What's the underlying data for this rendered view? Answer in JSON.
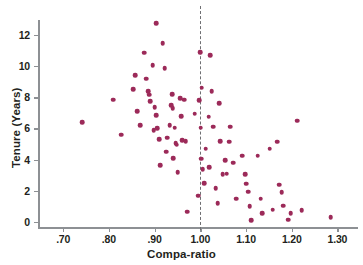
{
  "chart_data": {
    "type": "scatter",
    "title": "",
    "xlabel": "Compa-ratio",
    "ylabel": "Tenure (Years)",
    "xlim": [
      0.645,
      1.345
    ],
    "ylim": [
      -0.35,
      12.95
    ],
    "xticks": [
      0.7,
      0.8,
      0.9,
      1.0,
      1.1,
      1.2,
      1.3
    ],
    "xticklabels": [
      ".70",
      ".80",
      ".90",
      "1.00",
      "1.10",
      "1.20",
      "1.30"
    ],
    "yticks": [
      0,
      2,
      4,
      6,
      8,
      10,
      12
    ],
    "yticklabels": [
      "0",
      "2",
      "4",
      "6",
      "8",
      "10",
      "12"
    ],
    "grid": false,
    "legend": null,
    "marker_color": "#9c2a59",
    "marker_size": 4.6,
    "annotations": [
      {
        "name": "reference-line",
        "type": "vline",
        "x": 1.0,
        "style": "dashed",
        "color": "#6f6f72"
      }
    ],
    "points": [
      {
        "x": 0.742,
        "y": 6.4
      },
      {
        "x": 0.809,
        "y": 7.85
      },
      {
        "x": 0.827,
        "y": 5.6
      },
      {
        "x": 0.853,
        "y": 8.5
      },
      {
        "x": 0.858,
        "y": 9.4
      },
      {
        "x": 0.862,
        "y": 7.1
      },
      {
        "x": 0.868,
        "y": 6.2
      },
      {
        "x": 0.877,
        "y": 10.85
      },
      {
        "x": 0.882,
        "y": 9.2
      },
      {
        "x": 0.886,
        "y": 8.4
      },
      {
        "x": 0.888,
        "y": 8.15
      },
      {
        "x": 0.89,
        "y": 7.75
      },
      {
        "x": 0.896,
        "y": 10.05
      },
      {
        "x": 0.898,
        "y": 5.9
      },
      {
        "x": 0.9,
        "y": 7.35
      },
      {
        "x": 0.903,
        "y": 12.75
      },
      {
        "x": 0.904,
        "y": 6.85
      },
      {
        "x": 0.906,
        "y": 6.0
      },
      {
        "x": 0.91,
        "y": 5.3
      },
      {
        "x": 0.912,
        "y": 3.65
      },
      {
        "x": 0.918,
        "y": 11.45
      },
      {
        "x": 0.922,
        "y": 9.85
      },
      {
        "x": 0.925,
        "y": 4.5
      },
      {
        "x": 0.928,
        "y": 5.4
      },
      {
        "x": 0.933,
        "y": 6.2
      },
      {
        "x": 0.936,
        "y": 7.5
      },
      {
        "x": 0.938,
        "y": 8.2
      },
      {
        "x": 0.94,
        "y": 7.3
      },
      {
        "x": 0.941,
        "y": 4.1
      },
      {
        "x": 0.944,
        "y": 6.05
      },
      {
        "x": 0.946,
        "y": 5.05
      },
      {
        "x": 0.948,
        "y": 4.95
      },
      {
        "x": 0.951,
        "y": 3.2
      },
      {
        "x": 0.956,
        "y": 7.95
      },
      {
        "x": 0.958,
        "y": 6.8
      },
      {
        "x": 0.96,
        "y": 5.25
      },
      {
        "x": 0.965,
        "y": 7.85
      },
      {
        "x": 0.968,
        "y": 5.2
      },
      {
        "x": 0.972,
        "y": 0.65
      },
      {
        "x": 0.988,
        "y": 6.95
      },
      {
        "x": 0.995,
        "y": 1.7
      },
      {
        "x": 0.998,
        "y": 7.8
      },
      {
        "x": 1.0,
        "y": 10.9
      },
      {
        "x": 1.001,
        "y": 6.05
      },
      {
        "x": 1.002,
        "y": 4.05
      },
      {
        "x": 1.003,
        "y": 8.6
      },
      {
        "x": 1.005,
        "y": 3.4
      },
      {
        "x": 1.008,
        "y": 2.5
      },
      {
        "x": 1.012,
        "y": 4.7
      },
      {
        "x": 1.018,
        "y": 6.75
      },
      {
        "x": 1.02,
        "y": 3.5
      },
      {
        "x": 1.022,
        "y": 10.7
      },
      {
        "x": 1.025,
        "y": 8.4
      },
      {
        "x": 1.028,
        "y": 6.1
      },
      {
        "x": 1.034,
        "y": 2.15
      },
      {
        "x": 1.038,
        "y": 1.2
      },
      {
        "x": 1.042,
        "y": 7.6
      },
      {
        "x": 1.044,
        "y": 5.2
      },
      {
        "x": 1.049,
        "y": 3.05
      },
      {
        "x": 1.055,
        "y": 3.95
      },
      {
        "x": 1.058,
        "y": 3.1
      },
      {
        "x": 1.063,
        "y": 5.15
      },
      {
        "x": 1.066,
        "y": 6.1
      },
      {
        "x": 1.072,
        "y": 3.8
      },
      {
        "x": 1.078,
        "y": 1.5
      },
      {
        "x": 1.092,
        "y": 4.25
      },
      {
        "x": 1.098,
        "y": 3.05
      },
      {
        "x": 1.101,
        "y": 2.45
      },
      {
        "x": 1.105,
        "y": 1.95
      },
      {
        "x": 1.108,
        "y": 1.0
      },
      {
        "x": 1.112,
        "y": 0.1
      },
      {
        "x": 1.126,
        "y": 4.25
      },
      {
        "x": 1.132,
        "y": 1.5
      },
      {
        "x": 1.136,
        "y": 0.55
      },
      {
        "x": 1.152,
        "y": 4.7
      },
      {
        "x": 1.158,
        "y": 0.8
      },
      {
        "x": 1.168,
        "y": 5.15
      },
      {
        "x": 1.172,
        "y": 2.4
      },
      {
        "x": 1.178,
        "y": 1.9
      },
      {
        "x": 1.182,
        "y": 1.05
      },
      {
        "x": 1.192,
        "y": 0.15
      },
      {
        "x": 1.198,
        "y": 0.55
      },
      {
        "x": 1.212,
        "y": 6.5
      },
      {
        "x": 1.222,
        "y": 0.75
      },
      {
        "x": 1.285,
        "y": 0.3
      }
    ]
  }
}
